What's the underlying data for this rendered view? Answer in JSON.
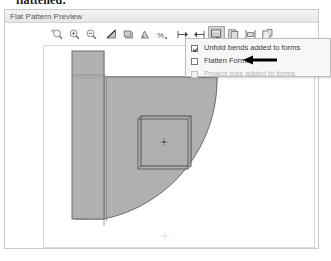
{
  "document": {
    "cutoff_heading": "flattened:"
  },
  "panel": {
    "title": "Flat Pattern Preview"
  },
  "toolbar": {
    "buttons": [
      {
        "name": "zoom-fit-icon",
        "label": "Zoom Fit",
        "pressed": false
      },
      {
        "name": "zoom-in-icon",
        "label": "Zoom In",
        "pressed": false
      },
      {
        "name": "zoom-out-icon",
        "label": "Zoom Out",
        "pressed": false
      },
      {
        "name": "bend-lines-icon",
        "label": "Bend Lines",
        "pressed": false
      },
      {
        "name": "bend-extents-icon",
        "label": "Bend Extents",
        "pressed": false
      },
      {
        "name": "bend-angle-icon",
        "label": "Bend Angle",
        "pressed": false
      },
      {
        "name": "bend-order-icon",
        "label": "Bend Order",
        "pressed": false
      },
      {
        "name": "tool-centers-icon",
        "label": "Tool Centers",
        "pressed": false
      },
      {
        "name": "punch-centers-icon",
        "label": "Punch Centers",
        "pressed": false
      },
      {
        "name": "flat-pattern-options-icon",
        "label": "Flat Pattern Options",
        "pressed": true
      },
      {
        "name": "copy-sketch-icon",
        "label": "Copy Sketch",
        "pressed": false
      },
      {
        "name": "extents-icon",
        "label": "Flat Pattern Extents",
        "pressed": false
      },
      {
        "name": "export-icon",
        "label": "Export Flat Pattern",
        "pressed": false
      }
    ]
  },
  "dropdown": {
    "items": [
      {
        "label": "Unfold bends added to forms",
        "checked": true,
        "enabled": true
      },
      {
        "label": "Flatten Forms",
        "checked": false,
        "enabled": true
      },
      {
        "label": "Project cuts added to forms",
        "checked": false,
        "enabled": false
      }
    ]
  },
  "annotation": {
    "arrow": "left-pointing-arrow",
    "points_at": "Flatten Forms"
  },
  "canvas": {
    "description": "Flat pattern preview of a quarter-round sheet metal part with a left flange and a square form feature",
    "shape_fill": "#b0b0b0",
    "shape_stroke": "#6f6f6f",
    "background": "#ffffff"
  }
}
